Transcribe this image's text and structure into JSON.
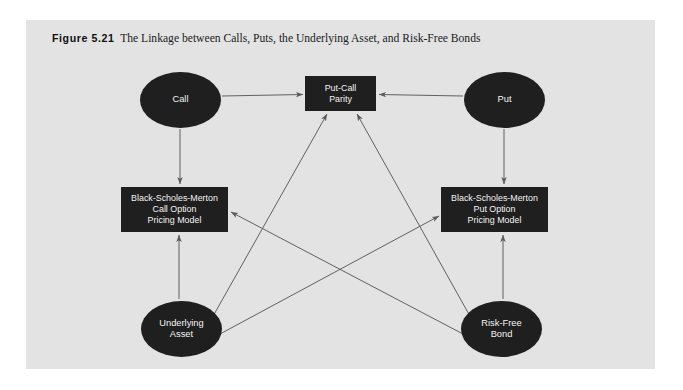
{
  "figure": {
    "label": "Figure 5.21",
    "caption": "The Linkage between Calls, Puts, the Underlying Asset, and Risk-Free Bonds"
  },
  "colors": {
    "page_background": "#ffffff",
    "panel_background": "#e3e3e4",
    "node_fill": "#201f20",
    "node_text": "#f3f3f3",
    "arrow_stroke": "#5a5a5c"
  },
  "nodes": [
    {
      "id": "call",
      "label": "Call",
      "shape": "ellipse"
    },
    {
      "id": "put",
      "label": "Put",
      "shape": "ellipse"
    },
    {
      "id": "parity",
      "label": "Put-Call\nParity",
      "shape": "rectangle"
    },
    {
      "id": "bsm_call",
      "label": "Black-Scholes-Merton\nCall Option\nPricing Model",
      "shape": "rectangle"
    },
    {
      "id": "bsm_put",
      "label": "Black-Scholes-Merton\nPut Option\nPricing Model",
      "shape": "rectangle"
    },
    {
      "id": "underlying",
      "label": "Underlying\nAsset",
      "shape": "ellipse"
    },
    {
      "id": "riskfree",
      "label": "Risk-Free\nBond",
      "shape": "ellipse"
    }
  ],
  "edges": [
    {
      "from": "call",
      "to": "parity",
      "direction": "one-way"
    },
    {
      "from": "put",
      "to": "parity",
      "direction": "one-way"
    },
    {
      "from": "call",
      "to": "bsm_call",
      "direction": "one-way"
    },
    {
      "from": "put",
      "to": "bsm_put",
      "direction": "one-way"
    },
    {
      "from": "underlying",
      "to": "bsm_call",
      "direction": "one-way"
    },
    {
      "from": "riskfree",
      "to": "bsm_put",
      "direction": "one-way"
    },
    {
      "from": "underlying",
      "to": "parity",
      "direction": "one-way"
    },
    {
      "from": "riskfree",
      "to": "parity",
      "direction": "one-way"
    },
    {
      "from": "underlying",
      "to": "bsm_put",
      "direction": "one-way"
    },
    {
      "from": "riskfree",
      "to": "bsm_call",
      "direction": "one-way"
    }
  ]
}
